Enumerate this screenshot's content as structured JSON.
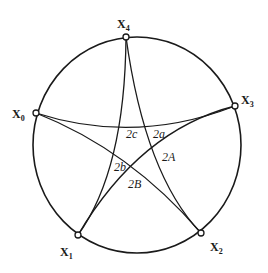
{
  "diagram": {
    "type": "spherical pentagram on circle",
    "colors": {
      "stroke": "#1a1a1a",
      "background": "#ffffff"
    },
    "circle": {
      "cx": 137,
      "cy": 145,
      "rx": 104,
      "ry": 108
    },
    "vertices": [
      {
        "id": "X0",
        "main": "X",
        "sub": "0",
        "x": 36,
        "y": 113,
        "lx": 12,
        "ly": 118
      },
      {
        "id": "X1",
        "main": "X",
        "sub": "1",
        "x": 78,
        "y": 235,
        "lx": 60,
        "ly": 256
      },
      {
        "id": "X2",
        "main": "X",
        "sub": "2",
        "x": 201,
        "y": 233,
        "lx": 210,
        "ly": 251
      },
      {
        "id": "X3",
        "main": "X",
        "sub": "3",
        "x": 235,
        "y": 106,
        "lx": 241,
        "ly": 104
      },
      {
        "id": "X4",
        "main": "X",
        "sub": "4",
        "x": 126,
        "y": 37,
        "lx": 117,
        "ly": 28
      }
    ],
    "arcs": [
      {
        "from": "X0",
        "to": "X3",
        "path": "M36,113 Q135,145 235,106"
      },
      {
        "from": "X0",
        "to": "X2",
        "path": "M36,113 Q130,150 201,233"
      },
      {
        "from": "X4",
        "to": "X1",
        "path": "M126,37 Q125,170 78,235"
      },
      {
        "from": "X4",
        "to": "X2",
        "path": "M126,37 Q145,175 201,233"
      },
      {
        "from": "X3",
        "to": "X1",
        "path": "M235,106 Q140,130 78,235"
      }
    ],
    "angle_labels": [
      {
        "text": "2c",
        "x": 126,
        "y": 138
      },
      {
        "text": "2a",
        "x": 153,
        "y": 138
      },
      {
        "text": "2A",
        "x": 162,
        "y": 161
      },
      {
        "text": "2b",
        "x": 114,
        "y": 171
      },
      {
        "text": "2B",
        "x": 128,
        "y": 188
      }
    ]
  }
}
